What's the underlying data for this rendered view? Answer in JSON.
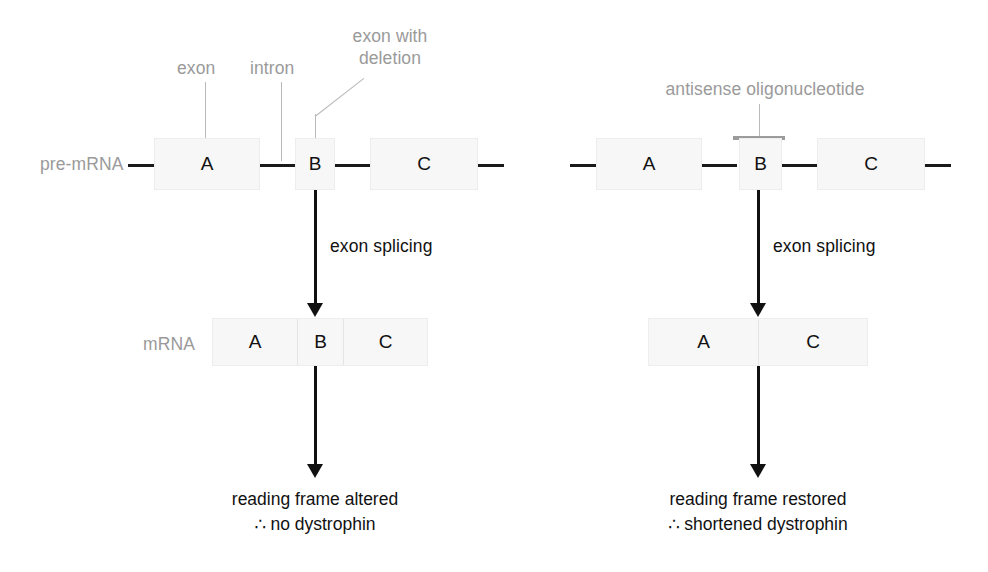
{
  "diagram": {
    "colors": {
      "label_gray": "#9a9a9a",
      "text_black": "#111111",
      "box_fill": "#f7f7f7",
      "box_border": "#ededed",
      "backbone_black": "#1a1a1a",
      "leader_gray": "#b9b9b9",
      "oligo_gray": "#9b9b9b"
    }
  },
  "left_panel": {
    "name": "untreated-pathway",
    "annotations": {
      "exon": "exon",
      "intron": "intron",
      "exon_with_deletion_line1": "exon with",
      "exon_with_deletion_line2": "deletion"
    },
    "pre_mrna": {
      "row_label": "pre-mRNA",
      "exons": [
        {
          "label": "A"
        },
        {
          "label": "B"
        },
        {
          "label": "C"
        }
      ]
    },
    "process_label": "exon splicing",
    "mrna": {
      "row_label": "mRNA",
      "segments": [
        {
          "label": "A"
        },
        {
          "label": "B"
        },
        {
          "label": "C"
        }
      ]
    },
    "outcome": {
      "line1": "reading frame altered",
      "line2": "∴ no dystrophin"
    }
  },
  "right_panel": {
    "name": "antisense-treated-pathway",
    "annotations": {
      "antisense_oligonucleotide": "antisense oligonucleotide"
    },
    "pre_mrna": {
      "exons": [
        {
          "label": "A"
        },
        {
          "label": "B"
        },
        {
          "label": "C"
        }
      ]
    },
    "process_label": "exon splicing",
    "mrna": {
      "segments": [
        {
          "label": "A"
        },
        {
          "label": "C"
        }
      ]
    },
    "outcome": {
      "line1": "reading frame restored",
      "line2": "∴ shortened dystrophin"
    }
  }
}
